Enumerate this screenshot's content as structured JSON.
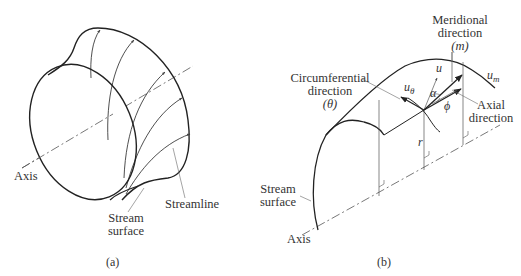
{
  "figure": {
    "panel_a": {
      "caption": "(a)",
      "labels": {
        "axis": "Axis",
        "streamline": "Streamline",
        "stream_surface_line1": "Stream",
        "stream_surface_line2": "surface"
      }
    },
    "panel_b": {
      "caption": "(b)",
      "labels": {
        "meridional_line1": "Meridional",
        "meridional_line2": "direction",
        "meridional_symbol": "(m)",
        "circumferential_line1": "Circumferential",
        "circumferential_line2": "direction",
        "circumferential_symbol": "(θ)",
        "axial_line1": "Axial",
        "axial_line2": "direction",
        "stream_surface_line1": "Stream",
        "stream_surface_line2": "surface",
        "axis": "Axis",
        "u": "u",
        "u_m": "u",
        "u_m_sub": "m",
        "u_theta": "u",
        "u_theta_sub": "θ",
        "alpha": "α",
        "phi": "ϕ",
        "r": "r"
      }
    }
  }
}
